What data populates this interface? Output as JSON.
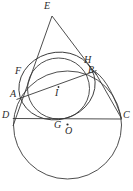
{
  "figure": {
    "background_color": "#ffffff",
    "stroke_color": "#3a3a3a",
    "label_color": "#2b2b2b"
  },
  "labels": {
    "E": "E",
    "F": "F",
    "H": "H",
    "B": "B",
    "A": "A",
    "I": "I",
    "D": "D",
    "G": "G",
    "O": "O",
    "C": "C"
  },
  "points": [
    {
      "id": "E",
      "label": "E",
      "x": 52.0,
      "y": 14.5,
      "label_x": 44,
      "label_y": 1,
      "marker": false
    },
    {
      "id": "F",
      "label": "F",
      "x": 27.0,
      "y": 79.0,
      "label_x": 15,
      "label_y": 66,
      "marker": false
    },
    {
      "id": "H",
      "label": "H",
      "x": 92.0,
      "y": 66.0,
      "label_x": 84,
      "label_y": 55,
      "marker": false
    },
    {
      "id": "B",
      "label": "B",
      "x": 94.5,
      "y": 72.5,
      "label_x": 88,
      "label_y": 65,
      "marker": false
    },
    {
      "id": "A",
      "label": "A",
      "x": 20.5,
      "y": 97.0,
      "label_x": 11,
      "label_y": 89,
      "marker": false
    },
    {
      "id": "I",
      "label": "I",
      "x": 58.5,
      "y": 87.0,
      "label_x": 55,
      "label_y": 88,
      "marker": true
    },
    {
      "id": "D",
      "label": "D",
      "x": 14.0,
      "y": 118.0,
      "label_x": 3,
      "label_y": 110,
      "marker": false
    },
    {
      "id": "G",
      "label": "G",
      "x": 62.0,
      "y": 119.0,
      "label_x": 55,
      "label_y": 120,
      "marker": false
    },
    {
      "id": "O",
      "label": "O",
      "x": 67.5,
      "y": 124.5,
      "label_x": 66,
      "label_y": 125,
      "marker": true
    },
    {
      "id": "C",
      "label": "C",
      "x": 121.5,
      "y": 119.0,
      "label_x": 123,
      "label_y": 110,
      "marker": false
    }
  ],
  "circles": [
    {
      "id": "circumcircle-DC",
      "name": "large-circle-through-D-and-C",
      "cx": 67.5,
      "cy": 125.0,
      "r": 54.0
    },
    {
      "id": "incircle-I",
      "name": "incircle-centered-at-I-tangent-to-DC-at-G",
      "cx": 58.5,
      "cy": 88.5,
      "r": 30.5
    },
    {
      "id": "circle-AFHB",
      "name": "circle-through-A-F-H-B",
      "cx": 57.0,
      "cy": 86.0,
      "r": 38.5,
      "rotation": -18
    }
  ],
  "segments": [
    {
      "id": "E-D",
      "name": "line-E-to-D",
      "x1": 52.0,
      "y1": 16.0,
      "x2": 13.0,
      "y2": 126.0
    },
    {
      "id": "E-C",
      "name": "line-E-to-C",
      "x1": 52.0,
      "y1": 16.0,
      "x2": 96.0,
      "y2": 75.0
    },
    {
      "id": "A-B",
      "name": "chord-A-to-B",
      "x1": 17.5,
      "y1": 99.0,
      "x2": 96.0,
      "y2": 71.0
    },
    {
      "id": "D-C",
      "name": "baseline-D-to-C",
      "x1": 13.0,
      "y1": 118.5,
      "x2": 122.0,
      "y2": 119.0
    },
    {
      "id": "B-C",
      "name": "line-B-to-C",
      "x1": 95.0,
      "y1": 72.0,
      "x2": 121.5,
      "y2": 118.5
    }
  ],
  "arcs": [
    {
      "id": "arc-B-C-outer",
      "name": "arc-bulging-right-from-B-to-C",
      "d": "M 95.0 71.5 C 107.0 80.0 115.5 99.0 121.5 118.5"
    }
  ]
}
